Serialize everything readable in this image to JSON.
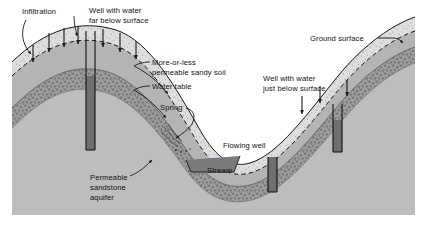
{
  "figure": {
    "background_color": "#ffffff",
    "panel_color": "#c9c9c9",
    "panel_rect": [
      12,
      4,
      403,
      211
    ]
  },
  "palette": {
    "text": "#111111",
    "panel_background": "#c9c9c9",
    "sky": "#ffffff",
    "sandy_soil": "#dedede",
    "unsaturated_zone": "#b4b4b4",
    "sandstone_aquifer": "#8f8f8f",
    "deep_bedrock": "#bdbdbd",
    "well_water": "#6f6f6f",
    "stream_water": "#7a7a7a",
    "line": "#1a1a1a"
  },
  "labels": [
    {
      "id": "infiltration",
      "name": "label-infiltration",
      "lines": [
        "Infiltration"
      ],
      "x": 22,
      "y": 14,
      "anchor": "start"
    },
    {
      "id": "well-far-below",
      "name": "label-well-water-far-below-surface",
      "lines": [
        "Well with water",
        "far below surface"
      ],
      "x": 89,
      "y": 13,
      "anchor": "start"
    },
    {
      "id": "ground-surface",
      "name": "label-ground-surface",
      "lines": [
        "Ground surface"
      ],
      "x": 310,
      "y": 41,
      "anchor": "start"
    },
    {
      "id": "permeable-sandy-soil",
      "name": "label-more-or-less-permeable-sandy-soil",
      "lines": [
        "More-or-less",
        "permeable sandy soil"
      ],
      "x": 152,
      "y": 65,
      "anchor": "start"
    },
    {
      "id": "water-table",
      "name": "label-water-table",
      "lines": [
        "Water table"
      ],
      "x": 152,
      "y": 89,
      "anchor": "start"
    },
    {
      "id": "well-just-below",
      "name": "label-well-water-just-below-surface",
      "lines": [
        "Well with water",
        "just below surface"
      ],
      "x": 263,
      "y": 81,
      "anchor": "start"
    },
    {
      "id": "spring",
      "name": "label-spring",
      "lines": [
        "Spring"
      ],
      "x": 160,
      "y": 110,
      "anchor": "start"
    },
    {
      "id": "flowing-well",
      "name": "label-flowing-well",
      "lines": [
        "Flowing well"
      ],
      "x": 223,
      "y": 148,
      "anchor": "start"
    },
    {
      "id": "stream",
      "name": "label-stream",
      "lines": [
        "Stream"
      ],
      "x": 207,
      "y": 173,
      "anchor": "start"
    },
    {
      "id": "permeable-sandstone-aquifer",
      "name": "label-permeable-sandstone-aquifer",
      "lines": [
        "Permeable",
        "sandstone",
        "aquifer"
      ],
      "x": 90,
      "y": 180,
      "anchor": "start"
    }
  ],
  "features": {
    "wells": [
      {
        "id": "well-left",
        "name": "well-deep-water-level",
        "description": "Well with water far below surface",
        "x": 86,
        "top_y": 31,
        "width": 9,
        "bottom_y": 150,
        "water_top_y": 76
      },
      {
        "id": "well-right",
        "name": "well-shallow-water-level",
        "description": "Well with water just below surface",
        "x": 333,
        "top_y": 104,
        "width": 9,
        "bottom_y": 152,
        "water_top_y": 120
      },
      {
        "id": "well-flowing",
        "name": "well-flowing-artesian",
        "description": "Flowing well",
        "x": 268,
        "top_y": 157,
        "width": 9,
        "bottom_y": 192,
        "water_top_y": 157
      }
    ],
    "infiltration_arrows": [
      {
        "x": 33,
        "y1": 45,
        "y2": 62
      },
      {
        "x": 49,
        "y1": 33,
        "y2": 52
      },
      {
        "x": 64,
        "y1": 28,
        "y2": 47
      },
      {
        "x": 78,
        "y1": 26,
        "y2": 44
      },
      {
        "x": 103,
        "y1": 29,
        "y2": 47
      },
      {
        "x": 120,
        "y1": 33,
        "y2": 52
      },
      {
        "x": 136,
        "y1": 41,
        "y2": 59
      },
      {
        "x": 302,
        "y1": 96,
        "y2": 114
      },
      {
        "x": 320,
        "y1": 86,
        "y2": 103
      },
      {
        "x": 347,
        "y1": 80,
        "y2": 96
      }
    ],
    "stream": {
      "name": "stream-channel",
      "x": 186,
      "y": 178,
      "width": 52,
      "depth": 12
    }
  },
  "legend_note": ""
}
